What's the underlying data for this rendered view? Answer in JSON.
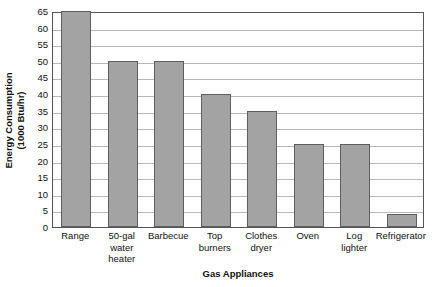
{
  "chart_data": {
    "type": "bar",
    "title": "",
    "xlabel": "Gas Appliances",
    "ylabel": "Energy Consumption",
    "ylabel_line1": "Energy Consumption",
    "ylabel_line2": "(1000 Btu/hr)",
    "ylim": [
      0,
      65
    ],
    "ytick_step": 5,
    "yticks": [
      0,
      5,
      10,
      15,
      20,
      25,
      30,
      35,
      40,
      45,
      50,
      55,
      60,
      65
    ],
    "grid": true,
    "legend": "none",
    "bar_color": "#a3a3a3",
    "bar_edge_color": "#5e5e5e",
    "grid_color": "#b8b8b8",
    "axis_color": "#555555",
    "categories": [
      "Range",
      "50-gal water heater",
      "Barbecue",
      "Top burners",
      "Clothes dryer",
      "Oven",
      "Log lighter",
      "Refrigerator"
    ],
    "category_lines": [
      [
        "Range"
      ],
      [
        "50-gal",
        "water",
        "heater"
      ],
      [
        "Barbecue"
      ],
      [
        "Top",
        "burners"
      ],
      [
        "Clothes",
        "dryer"
      ],
      [
        "Oven"
      ],
      [
        "Log",
        "lighter"
      ],
      [
        "Refrigerator"
      ]
    ],
    "values": [
      65,
      50,
      50,
      40,
      35,
      25,
      25,
      4
    ]
  }
}
